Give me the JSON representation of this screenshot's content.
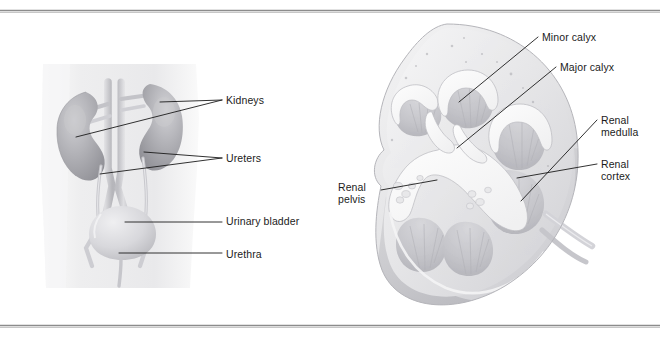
{
  "figure": {
    "background_color": "#ffffff",
    "rule_color": "#8c8c8c",
    "label_color": "#1b1b1b",
    "width": 672,
    "height": 348
  },
  "panels": [
    {
      "id": "left-panel",
      "name": "urinary-system-overview",
      "illustration": "anterior view of torso with kidneys, ureters, urinary bladder and urethra"
    },
    {
      "id": "right-panel",
      "name": "kidney-frontal-section",
      "illustration": "frontal section of a kidney showing calyces, medulla, cortex and renal pelvis"
    }
  ],
  "labels": {
    "left": [
      {
        "id": "kidneys",
        "text": "Kidneys",
        "x": 226,
        "y": 104
      },
      {
        "id": "ureters",
        "text": "Ureters",
        "x": 226,
        "y": 162
      },
      {
        "id": "urinary_bladder",
        "text": "Urinary bladder",
        "x": 226,
        "y": 225
      },
      {
        "id": "urethra",
        "text": "Urethra",
        "x": 226,
        "y": 258
      }
    ],
    "right": [
      {
        "id": "minor_calyx",
        "text": "Minor calyx",
        "x": 542,
        "y": 41
      },
      {
        "id": "major_calyx",
        "text": "Major calyx",
        "x": 560,
        "y": 71
      },
      {
        "id": "renal_medulla_line1",
        "text": "Renal",
        "x": 601,
        "y": 124
      },
      {
        "id": "renal_medulla_line2",
        "text": "medulla",
        "x": 601,
        "y": 136
      },
      {
        "id": "renal_cortex_line1",
        "text": "Renal",
        "x": 601,
        "y": 168
      },
      {
        "id": "renal_cortex_line2",
        "text": "cortex",
        "x": 601,
        "y": 180
      },
      {
        "id": "renal_pelvis_line1",
        "text": "Renal",
        "x": 338,
        "y": 191
      },
      {
        "id": "renal_pelvis_line2",
        "text": "pelvis",
        "x": 338,
        "y": 203
      }
    ]
  },
  "palette": {
    "body_silhouette": "#ededee",
    "kidney_fill": "#a9a9ad",
    "kidney_fill_light": "#c4c4c8",
    "vessel": "#c9c9cd",
    "bladder": "#d2d2d6",
    "section_cortex": "#e2e2e4",
    "section_medulla": "#c6c6ca",
    "section_cavity": "#f6f6f7",
    "section_outline": "#aeaeb2",
    "section_lower": "#c0c0c5"
  }
}
